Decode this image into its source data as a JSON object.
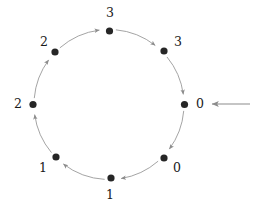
{
  "diagram": {
    "type": "directed-cycle-graph",
    "node_count": 8,
    "direction": "clockwise",
    "center": {
      "x": 109,
      "y": 104.5
    },
    "radius": 75,
    "colors": {
      "node_fill": "#262626",
      "arc_stroke": "#9a9a9a",
      "arrow_stroke": "#8c8c8c",
      "label_text": "#1a1a1a",
      "background": "#ffffff"
    },
    "nodes": [
      {
        "id": "node-top",
        "label": "3",
        "x": 109.5,
        "y": 31,
        "label_x": 110,
        "label_y": 13,
        "angle_deg": 270
      },
      {
        "id": "node-upper-right",
        "label": "3",
        "x": 164,
        "y": 51,
        "label_x": 178,
        "label_y": 42,
        "angle_deg": 315
      },
      {
        "id": "node-right",
        "label": "0",
        "x": 184.5,
        "y": 104.5,
        "label_x": 200,
        "label_y": 104,
        "angle_deg": 0
      },
      {
        "id": "node-lower-right",
        "label": "0",
        "x": 164,
        "y": 158,
        "label_x": 177,
        "label_y": 168,
        "angle_deg": 45
      },
      {
        "id": "node-bottom",
        "label": "1",
        "x": 111,
        "y": 178,
        "label_x": 110,
        "label_y": 195,
        "angle_deg": 90
      },
      {
        "id": "node-lower-left",
        "label": "1",
        "x": 56,
        "y": 157,
        "label_x": 43,
        "label_y": 168,
        "angle_deg": 135
      },
      {
        "id": "node-left",
        "label": "2",
        "x": 33,
        "y": 104.5,
        "label_x": 18,
        "label_y": 104,
        "angle_deg": 180
      },
      {
        "id": "node-upper-left",
        "label": "2",
        "x": 55,
        "y": 52,
        "label_x": 44,
        "label_y": 42,
        "angle_deg": 225
      }
    ],
    "edges": [
      {
        "id": "edge-top-to-upper-right",
        "from": "node-top",
        "to": "node-upper-right"
      },
      {
        "id": "edge-upper-right-to-right",
        "from": "node-upper-right",
        "to": "node-right"
      },
      {
        "id": "edge-right-to-lower-right",
        "from": "node-right",
        "to": "node-lower-right"
      },
      {
        "id": "edge-lower-right-to-bottom",
        "from": "node-lower-right",
        "to": "node-bottom"
      },
      {
        "id": "edge-bottom-to-lower-left",
        "from": "node-bottom",
        "to": "node-lower-left"
      },
      {
        "id": "edge-lower-left-to-left",
        "from": "node-lower-left",
        "to": "node-left"
      },
      {
        "id": "edge-left-to-upper-left",
        "from": "node-left",
        "to": "node-upper-left"
      },
      {
        "id": "edge-upper-left-to-top",
        "from": "node-upper-left",
        "to": "node-top"
      }
    ],
    "entry_arrow": {
      "id": "entry-arrow",
      "from_x": 250,
      "to_x": 212,
      "y": 104,
      "points_to": "node-right",
      "direction": "left"
    }
  }
}
